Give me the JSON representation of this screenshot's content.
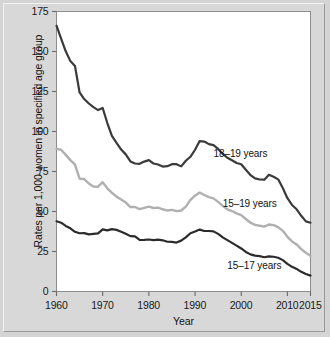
{
  "chart_data": {
    "type": "line",
    "title": "",
    "xlabel": "Year",
    "ylabel": "Rates per 1,000 women in specified age group",
    "xlim": [
      1960,
      2015
    ],
    "ylim": [
      0,
      175
    ],
    "xticks": [
      "1960",
      "1970",
      "1980",
      "1990",
      "2000",
      "2010",
      "2015"
    ],
    "xtick_values": [
      1960,
      1970,
      1980,
      1990,
      2000,
      2010,
      2015
    ],
    "yticks": [
      "0",
      "25",
      "50",
      "75",
      "100",
      "125",
      "150",
      "175"
    ],
    "ytick_values": [
      0,
      25,
      50,
      75,
      100,
      125,
      150,
      175
    ],
    "grid": false,
    "legend_position": "inline-annotations",
    "x": [
      1960,
      1961,
      1962,
      1963,
      1964,
      1965,
      1966,
      1967,
      1968,
      1969,
      1970,
      1971,
      1972,
      1973,
      1974,
      1975,
      1976,
      1977,
      1978,
      1979,
      1980,
      1981,
      1982,
      1983,
      1984,
      1985,
      1986,
      1987,
      1988,
      1989,
      1990,
      1991,
      1992,
      1993,
      1994,
      1995,
      1996,
      1997,
      1998,
      1999,
      2000,
      2001,
      2002,
      2003,
      2004,
      2005,
      2006,
      2007,
      2008,
      2009,
      2010,
      2011,
      2012,
      2013,
      2014,
      2015
    ],
    "series": [
      {
        "name": "18–19 years",
        "color": "#3a3a3a",
        "label_x": 1994,
        "label_y": 86,
        "values": [
          166.1,
          158.1,
          150.1,
          144.0,
          141.0,
          124.4,
          120.3,
          117.5,
          115.2,
          113.4,
          114.7,
          105.3,
          97.3,
          92.9,
          88.7,
          85.7,
          81.3,
          80.0,
          79.8,
          81.2,
          82.1,
          80.0,
          79.4,
          78.1,
          78.3,
          79.6,
          79.6,
          78.2,
          81.7,
          84.2,
          88.6,
          94.0,
          93.7,
          92.1,
          91.5,
          89.1,
          86.0,
          83.6,
          82.0,
          80.3,
          79.5,
          76.1,
          72.8,
          70.7,
          70.0,
          69.9,
          73.0,
          71.7,
          70.1,
          64.7,
          58.3,
          54.1,
          51.4,
          47.3,
          43.8,
          43.0
        ]
      },
      {
        "name": "15–19 years",
        "color": "#b0b0b0",
        "label_x": 1996,
        "label_y": 55,
        "values": [
          89.1,
          88.6,
          85.4,
          82.1,
          79.3,
          70.5,
          70.3,
          67.5,
          65.6,
          65.5,
          68.3,
          64.5,
          61.7,
          59.3,
          57.5,
          55.6,
          52.8,
          52.8,
          51.5,
          52.3,
          53.0,
          52.2,
          52.4,
          51.4,
          50.6,
          51.0,
          50.2,
          50.6,
          53.0,
          57.3,
          59.9,
          61.8,
          60.3,
          59.0,
          58.2,
          56.0,
          53.5,
          51.3,
          50.3,
          48.8,
          47.7,
          45.3,
          43.0,
          41.6,
          41.1,
          40.5,
          41.9,
          41.5,
          40.2,
          37.9,
          34.2,
          31.3,
          29.4,
          26.5,
          24.2,
          22.3
        ]
      },
      {
        "name": "15–17 years",
        "color": "#2b2b2b",
        "label_x": 1997,
        "label_y": 16,
        "values": [
          43.9,
          43.0,
          41.0,
          39.5,
          37.3,
          36.4,
          36.5,
          35.7,
          36.0,
          36.3,
          38.8,
          38.2,
          39.0,
          38.5,
          37.4,
          36.1,
          34.6,
          34.5,
          32.2,
          32.3,
          32.5,
          32.1,
          32.4,
          32.0,
          31.1,
          31.0,
          30.6,
          31.8,
          33.8,
          36.4,
          37.5,
          38.7,
          37.8,
          37.8,
          37.6,
          36.0,
          33.8,
          32.1,
          30.4,
          28.7,
          26.9,
          24.7,
          23.2,
          22.4,
          22.1,
          21.4,
          22.0,
          21.7,
          21.1,
          19.6,
          17.3,
          15.4,
          14.1,
          12.3,
          10.9,
          9.9
        ]
      }
    ]
  },
  "axis": {
    "x_label": "Year",
    "y_label": "Rates per 1,000 women in specified age group"
  }
}
